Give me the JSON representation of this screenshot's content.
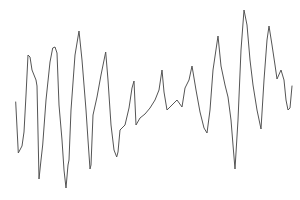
{
  "chart_data": {
    "type": "line",
    "title": "",
    "xlabel": "",
    "ylabel": "",
    "grid": false,
    "axes_visible": false,
    "legend": null,
    "line_color": "#555555",
    "background": "#ffffff",
    "points_px": [
      [
        15.7,
        102
      ],
      [
        18.3,
        153
      ],
      [
        22,
        146
      ],
      [
        24,
        132
      ],
      [
        26,
        95
      ],
      [
        28,
        55
      ],
      [
        30,
        57
      ],
      [
        32,
        70
      ],
      [
        36,
        80
      ],
      [
        37,
        86
      ],
      [
        39,
        179
      ],
      [
        41,
        160
      ],
      [
        42.7,
        145
      ],
      [
        46,
        100
      ],
      [
        50,
        62
      ],
      [
        52.7,
        48
      ],
      [
        55,
        47
      ],
      [
        57,
        53
      ],
      [
        59,
        105
      ],
      [
        62,
        140
      ],
      [
        64,
        170
      ],
      [
        66,
        188
      ],
      [
        68,
        165
      ],
      [
        69,
        160
      ],
      [
        71,
        110
      ],
      [
        75,
        55
      ],
      [
        79,
        31
      ],
      [
        82,
        60
      ],
      [
        86,
        110
      ],
      [
        88,
        140
      ],
      [
        90,
        169
      ],
      [
        91,
        165
      ],
      [
        93,
        115
      ],
      [
        97,
        97
      ],
      [
        101,
        75
      ],
      [
        105.7,
        52
      ],
      [
        108,
        80
      ],
      [
        111,
        125
      ],
      [
        114,
        150
      ],
      [
        116.7,
        157
      ],
      [
        118,
        152
      ],
      [
        120,
        130
      ],
      [
        125,
        125
      ],
      [
        129,
        108
      ],
      [
        132,
        88
      ],
      [
        134,
        81
      ],
      [
        136,
        125
      ],
      [
        140,
        118
      ],
      [
        145,
        114
      ],
      [
        150,
        108
      ],
      [
        155,
        100
      ],
      [
        159,
        90
      ],
      [
        162,
        70
      ],
      [
        164,
        92
      ],
      [
        167,
        110
      ],
      [
        172,
        105
      ],
      [
        177,
        100
      ],
      [
        182,
        107
      ],
      [
        185,
        88
      ],
      [
        189,
        80
      ],
      [
        192,
        66
      ],
      [
        196,
        90
      ],
      [
        200,
        112
      ],
      [
        204,
        128
      ],
      [
        207,
        133
      ],
      [
        210,
        110
      ],
      [
        213,
        70
      ],
      [
        218,
        36
      ],
      [
        221,
        66
      ],
      [
        225,
        85
      ],
      [
        228,
        97
      ],
      [
        231,
        120
      ],
      [
        233,
        145
      ],
      [
        235,
        169
      ],
      [
        238,
        120
      ],
      [
        241,
        50
      ],
      [
        244,
        10
      ],
      [
        247,
        25
      ],
      [
        250,
        60
      ],
      [
        253,
        85
      ],
      [
        257,
        110
      ],
      [
        261,
        129
      ],
      [
        264,
        80
      ],
      [
        267,
        40
      ],
      [
        269,
        26
      ],
      [
        272,
        45
      ],
      [
        275,
        65
      ],
      [
        277,
        79
      ],
      [
        281,
        70
      ],
      [
        284,
        80
      ],
      [
        286,
        100
      ],
      [
        288,
        110
      ],
      [
        290,
        108
      ],
      [
        292,
        86
      ]
    ],
    "series": [
      {
        "name": "signal",
        "x": [
          15.7,
          18.3,
          28,
          39,
          52.7,
          66,
          79,
          90,
          105.7,
          116.7,
          134,
          136,
          162,
          167,
          192,
          207,
          218,
          235,
          244,
          261,
          269,
          277,
          281,
          288,
          292
        ],
        "y_relative": [
          0.54,
          0.26,
          0.8,
          0.12,
          0.85,
          0.07,
          0.93,
          0.17,
          0.84,
          0.23,
          0.66,
          0.42,
          0.71,
          0.49,
          0.73,
          0.37,
          0.89,
          0.17,
          1.0,
          0.4,
          0.94,
          0.66,
          0.71,
          0.5,
          0.63
        ]
      }
    ]
  }
}
